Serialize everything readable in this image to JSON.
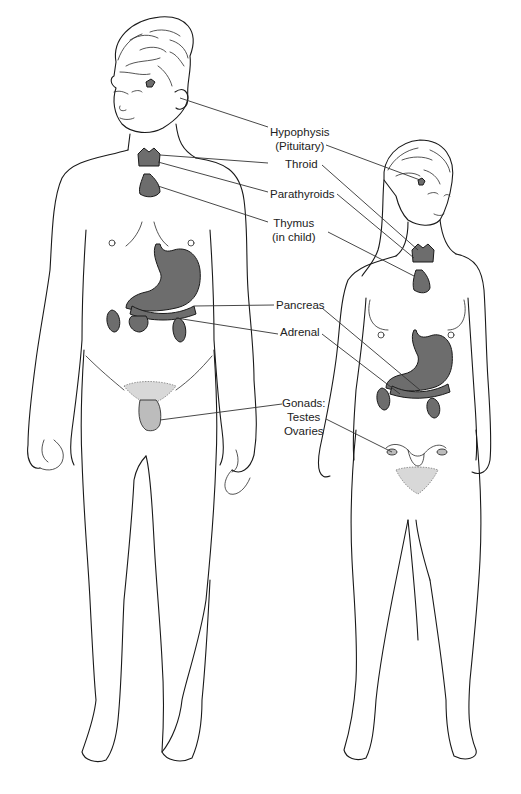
{
  "figure": {
    "colors": {
      "background": "#ffffff",
      "line": "#1a1a1a",
      "organ_fill": "#6d6d6d",
      "label_text": "#222222"
    }
  },
  "labels": {
    "hypophysis": {
      "line1": "Hypophysis",
      "line2": "(Pituitary)"
    },
    "thyroid": {
      "line1": "Throid"
    },
    "parathyroids": {
      "line1": "Parathyroids"
    },
    "thymus": {
      "line1": "Thymus",
      "line2": "(in child)"
    },
    "pancreas": {
      "line1": "Pancreas"
    },
    "adrenal": {
      "line1": "Adrenal"
    },
    "gonads": {
      "line1": "Gonads:",
      "line2": "Testes",
      "line3": "Ovaries"
    }
  },
  "figures": {
    "male": {
      "name": "male-figure"
    },
    "female": {
      "name": "female-figure"
    }
  }
}
